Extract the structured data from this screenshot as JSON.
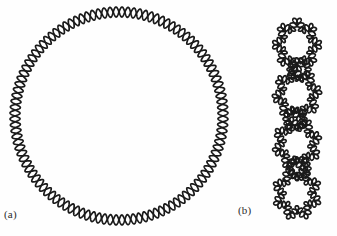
{
  "figure": {
    "background_color": "#fefefe",
    "stroke_color": "#1a1a1a",
    "panels": [
      {
        "key": "a",
        "label": "(a)",
        "caption_text": "(a)",
        "shape": "braided-circle",
        "description": "relaxed circular two-strand braid",
        "center_x": 119,
        "center_y": 116,
        "radius": 104,
        "braid_turns": 56,
        "braid_amplitude": 5.0,
        "stroke_width": 1.7
      },
      {
        "key": "b",
        "label": "(b)",
        "caption_text": "(b)",
        "shape": "braided-lobed-chain",
        "description": "supercoiled chain of four lobed braided loops",
        "center_x": 297,
        "top_y": 20,
        "bottom_y": 218,
        "unit_count": 4,
        "unit_height": 50,
        "unit_width": 50,
        "lobes_per_unit": 8,
        "braid_turns_per_unit": 24,
        "braid_amplitude": 3.6,
        "stroke_width": 1.7
      }
    ]
  },
  "chart_data": {
    "type": "diagram",
    "title": "",
    "xlabel": "",
    "ylabel": "",
    "legend": [],
    "annotations": [
      "(a)",
      "(b)"
    ],
    "series": [
      {
        "name": "(a) relaxed braided circle",
        "geometry": "circle",
        "cx": 119,
        "cy": 116,
        "r": 104,
        "twists": 56,
        "twist_amplitude": 5.0
      },
      {
        "name": "(b) condensed braided chain",
        "geometry": "vertical-chain",
        "cx": 297,
        "y_start": 20,
        "y_end": 218,
        "units": 4,
        "lobes": 8,
        "twists_per_unit": 24,
        "twist_amplitude": 3.6
      }
    ]
  }
}
